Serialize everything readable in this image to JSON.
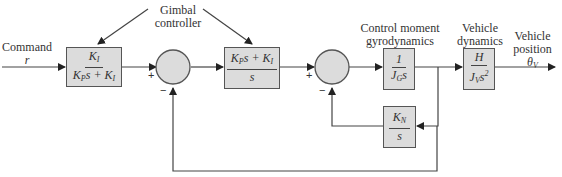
{
  "labels": {
    "command_line1": "Command",
    "command_line2": "r",
    "gimbal_line1": "Gimbal",
    "gimbal_line2": "controller",
    "cmg_line1": "Control moment",
    "cmg_line2": "gyrodynamics",
    "vehicle_dyn_line1": "Vehicle",
    "vehicle_dyn_line2": "dynamics",
    "vehicle_pos_line1": "Vehicle",
    "vehicle_pos_line2": "position",
    "vehicle_pos_symbol": "θ",
    "vehicle_pos_sub": "V"
  },
  "blocks": {
    "prefilter": {
      "num_main": "K",
      "num_sub": "I",
      "den_a": "K",
      "den_a_sub": "P",
      "den_b": "s + K",
      "den_b_sub": "I"
    },
    "pi_controller": {
      "num_a": "K",
      "num_a_sub": "P",
      "num_b": "s + K",
      "num_b_sub": "I",
      "den": "s"
    },
    "cmg": {
      "num": "1",
      "den_a": "J",
      "den_a_sub": "G",
      "den_b": "s"
    },
    "vehicle": {
      "num": "H",
      "den_a": "J",
      "den_a_sub": "V",
      "den_b": "s",
      "den_sup": "2"
    },
    "feedback_kn": {
      "num_a": "K",
      "num_a_sub": "N",
      "den": "s"
    }
  },
  "summing_junctions": {
    "sum1": {
      "plus": "+",
      "minus": "−"
    },
    "sum2": {
      "plus": "+",
      "minus": "−"
    }
  },
  "colors": {
    "block_fill": "#dcdcdc",
    "junction_fill": "#dcdcdc",
    "line": "#444444"
  }
}
